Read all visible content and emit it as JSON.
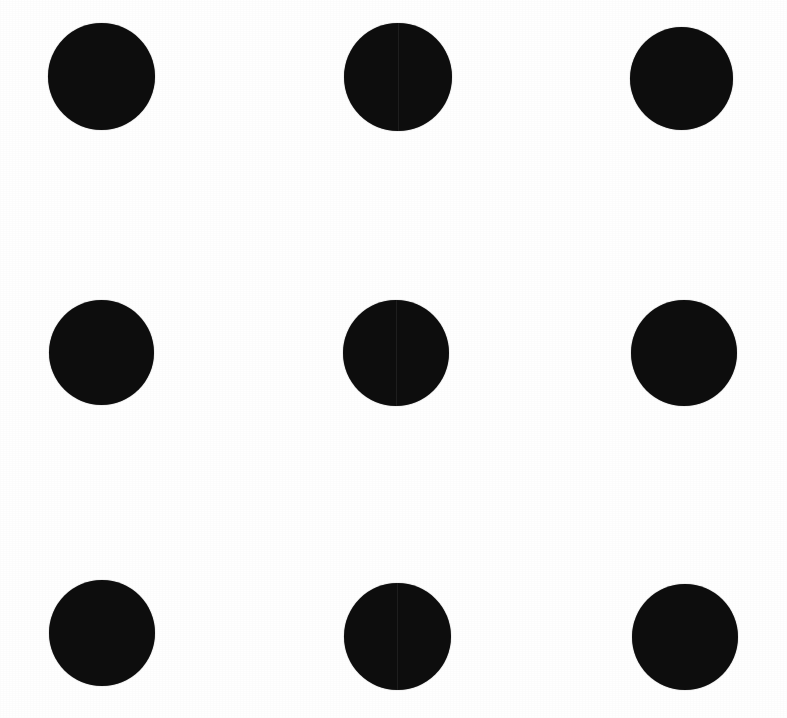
{
  "image": {
    "kind": "dot-grid",
    "width": 787,
    "height": 718,
    "background_color": "#ffffff",
    "dot_color": "#0d0d0d",
    "rows": 3,
    "columns": 3,
    "dot_count": 9,
    "artifact": "faint vertical seam through middle column dots"
  },
  "grid": {
    "column_centers_x": [
      101,
      397,
      683
    ],
    "row_centers_y": [
      76,
      353,
      636
    ],
    "column_spacing": 291,
    "row_spacing": 280
  },
  "dots": [
    {
      "name": "dot-top-left",
      "row": 1,
      "col": 1,
      "cx": 101,
      "cy": 76,
      "d": 107,
      "seam": false
    },
    {
      "name": "dot-top-center",
      "row": 1,
      "col": 2,
      "cx": 398,
      "cy": 77,
      "d": 108,
      "seam": true
    },
    {
      "name": "dot-top-right",
      "row": 1,
      "col": 3,
      "cx": 681,
      "cy": 78,
      "d": 103,
      "seam": false
    },
    {
      "name": "dot-middle-left",
      "row": 2,
      "col": 1,
      "cx": 101,
      "cy": 352,
      "d": 105,
      "seam": false
    },
    {
      "name": "dot-middle-center",
      "row": 2,
      "col": 2,
      "cx": 396,
      "cy": 353,
      "d": 106,
      "seam": true
    },
    {
      "name": "dot-middle-right",
      "row": 2,
      "col": 3,
      "cx": 684,
      "cy": 353,
      "d": 106,
      "seam": false
    },
    {
      "name": "dot-bottom-left",
      "row": 3,
      "col": 1,
      "cx": 102,
      "cy": 633,
      "d": 106,
      "seam": false
    },
    {
      "name": "dot-bottom-center",
      "row": 3,
      "col": 2,
      "cx": 397,
      "cy": 636,
      "d": 107,
      "seam": true
    },
    {
      "name": "dot-bottom-right",
      "row": 3,
      "col": 3,
      "cx": 685,
      "cy": 637,
      "d": 106,
      "seam": false
    }
  ]
}
